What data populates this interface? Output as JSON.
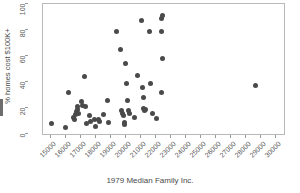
{
  "chart_data": {
    "type": "scatter",
    "title": "",
    "xlabel": "1979 Median Family Inc.",
    "ylabel": "% homes cost $100K+",
    "xlim": [
      14500,
      30500
    ],
    "ylim": [
      0,
      100
    ],
    "grid": false,
    "legend": null,
    "marker": {
      "shape": "circle",
      "color": "#4a4a4a",
      "size": 5
    },
    "xticks": [
      15000,
      16000,
      17000,
      18000,
      19000,
      20000,
      21000,
      22000,
      23000,
      24000,
      25000,
      26000,
      27000,
      28000,
      29000,
      30000
    ],
    "xtick_labels": [
      "15000",
      "16000",
      "17000",
      "18000",
      "19000",
      "20000",
      "21000",
      "22000",
      "23000",
      "24000",
      "25000",
      "26000",
      "27000",
      "28000",
      "29000",
      "30000"
    ],
    "yticks": [
      0,
      20,
      40,
      60,
      80,
      100
    ],
    "ytick_labels": [
      "0",
      "20",
      "40",
      "60",
      "80",
      "100"
    ],
    "points": [
      {
        "x": 15050,
        "y": 8
      },
      {
        "x": 16000,
        "y": 5
      },
      {
        "x": 16180,
        "y": 32
      },
      {
        "x": 16540,
        "y": 13
      },
      {
        "x": 16600,
        "y": 11
      },
      {
        "x": 16660,
        "y": 15
      },
      {
        "x": 16700,
        "y": 17
      },
      {
        "x": 16760,
        "y": 19
      },
      {
        "x": 16820,
        "y": 21
      },
      {
        "x": 16880,
        "y": 16
      },
      {
        "x": 17060,
        "y": 25
      },
      {
        "x": 17120,
        "y": 22
      },
      {
        "x": 17240,
        "y": 44
      },
      {
        "x": 17300,
        "y": 21
      },
      {
        "x": 17360,
        "y": 8
      },
      {
        "x": 17600,
        "y": 14
      },
      {
        "x": 17660,
        "y": 10
      },
      {
        "x": 17900,
        "y": 11
      },
      {
        "x": 17960,
        "y": 6
      },
      {
        "x": 18200,
        "y": 11
      },
      {
        "x": 18260,
        "y": 10
      },
      {
        "x": 18500,
        "y": 15
      },
      {
        "x": 18800,
        "y": 26
      },
      {
        "x": 18860,
        "y": 9
      },
      {
        "x": 19400,
        "y": 79
      },
      {
        "x": 19640,
        "y": 65
      },
      {
        "x": 19700,
        "y": 18
      },
      {
        "x": 19760,
        "y": 16
      },
      {
        "x": 19820,
        "y": 14
      },
      {
        "x": 19880,
        "y": 9
      },
      {
        "x": 19940,
        "y": 7
      },
      {
        "x": 20000,
        "y": 54
      },
      {
        "x": 20060,
        "y": 39
      },
      {
        "x": 20120,
        "y": 26
      },
      {
        "x": 20180,
        "y": 18
      },
      {
        "x": 20240,
        "y": 16
      },
      {
        "x": 20600,
        "y": 13
      },
      {
        "x": 20780,
        "y": 45
      },
      {
        "x": 21020,
        "y": 87
      },
      {
        "x": 21080,
        "y": 36
      },
      {
        "x": 21140,
        "y": 28
      },
      {
        "x": 21200,
        "y": 20
      },
      {
        "x": 21260,
        "y": 18
      },
      {
        "x": 21320,
        "y": 19
      },
      {
        "x": 21560,
        "y": 79
      },
      {
        "x": 21620,
        "y": 39
      },
      {
        "x": 21800,
        "y": 16
      },
      {
        "x": 22040,
        "y": 12
      },
      {
        "x": 22340,
        "y": 89
      },
      {
        "x": 22460,
        "y": 91
      },
      {
        "x": 22400,
        "y": 79
      },
      {
        "x": 22460,
        "y": 58
      },
      {
        "x": 22340,
        "y": 32
      },
      {
        "x": 28580,
        "y": 37
      }
    ]
  }
}
